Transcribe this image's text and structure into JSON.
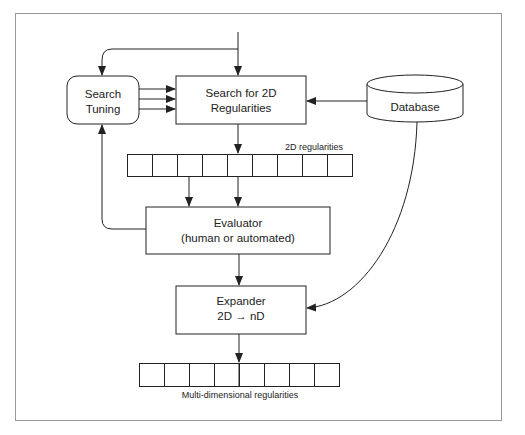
{
  "diagram": {
    "nodes": {
      "search_tuning": {
        "line1": "Search",
        "line2": "Tuning"
      },
      "search_2d": {
        "line1": "Search for 2D",
        "line2": "Regularities"
      },
      "database": {
        "label": "Database"
      },
      "evaluator": {
        "line1": "Evaluator",
        "line2": "(human or automated)"
      },
      "expander": {
        "line1": "Expander",
        "line2": "2D → nD"
      }
    },
    "arrays": {
      "regularities_2d": {
        "label": "2D regularities",
        "cells": 9
      },
      "regularities_nd": {
        "label": "Multi-dimensional regularities",
        "cells": 8
      }
    },
    "edges": [
      {
        "from": "input",
        "to": "search_2d"
      },
      {
        "from": "input",
        "to": "search_tuning"
      },
      {
        "from": "search_tuning",
        "to": "search_2d",
        "count": 3
      },
      {
        "from": "database",
        "to": "search_2d"
      },
      {
        "from": "search_2d",
        "to": "regularities_2d"
      },
      {
        "from": "regularities_2d",
        "to": "evaluator",
        "count": 2
      },
      {
        "from": "evaluator",
        "to": "search_tuning"
      },
      {
        "from": "evaluator",
        "to": "expander"
      },
      {
        "from": "database",
        "to": "expander"
      },
      {
        "from": "expander",
        "to": "regularities_nd"
      }
    ]
  }
}
